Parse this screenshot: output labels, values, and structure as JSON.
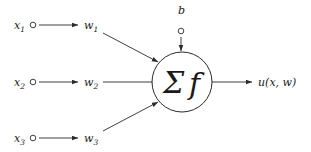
{
  "diagram": {
    "background_color": "#ffffff",
    "stroke_color": "#2b2b2b",
    "text_color": "#1a1a1a"
  },
  "inputs": [
    {
      "base": "x",
      "sub": "1",
      "dot_x": 33,
      "dot_y": 25,
      "label_x": 14,
      "label_y": 29
    },
    {
      "base": "x",
      "sub": "2",
      "dot_x": 33,
      "dot_y": 82,
      "label_x": 14,
      "label_y": 86
    },
    {
      "base": "x",
      "sub": "3",
      "dot_x": 33,
      "dot_y": 138,
      "label_x": 14,
      "label_y": 142
    }
  ],
  "weights": [
    {
      "base": "w",
      "sub": "1",
      "label_x": 84,
      "label_y": 29
    },
    {
      "base": "w",
      "sub": "2",
      "label_x": 84,
      "label_y": 86
    },
    {
      "base": "w",
      "sub": "3",
      "label_x": 84,
      "label_y": 142
    }
  ],
  "bias": {
    "base": "b",
    "label_x": 178,
    "label_y": 14,
    "dot_x": 181,
    "dot_y": 31
  },
  "soma": {
    "center_x": 182,
    "center_y": 82,
    "radius": 30,
    "symbol_sigma": "Σ",
    "symbol_f": "f"
  },
  "output": {
    "base": "u",
    "expression": "(x, w)",
    "label_x": 258,
    "label_y": 86
  },
  "edges": {
    "input_arrow_start_x": 39,
    "input_arrow_end_x": 78,
    "weight_line_start_x": 103,
    "top_diag": {
      "x1": 103,
      "y1": 33,
      "x2": 158,
      "y2": 62
    },
    "mid_line": {
      "x1": 103,
      "y1": 82,
      "x2": 151,
      "y2": 82
    },
    "bot_diag": {
      "x1": 103,
      "y1": 131,
      "x2": 158,
      "y2": 102
    },
    "bias_line": {
      "x1": 181,
      "y1": 37,
      "x2": 181,
      "y2": 51
    },
    "output_line": {
      "x1": 212,
      "y1": 82,
      "x2": 252,
      "y2": 82
    }
  }
}
